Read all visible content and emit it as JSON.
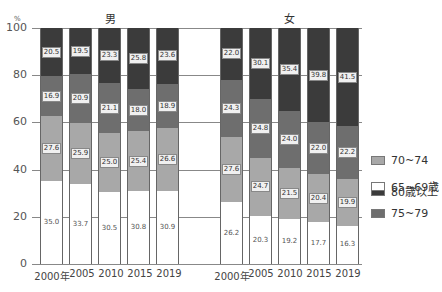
{
  "chart_data": {
    "type": "stacked-bar",
    "title": "",
    "ylabel": "%",
    "ylim": [
      0,
      100
    ],
    "yticks": [
      "0",
      "20",
      "40",
      "60",
      "80",
      "100"
    ],
    "panels": [
      {
        "title": "男",
        "categories": [
          "2000年",
          "2005",
          "2010",
          "2015",
          "2019"
        ],
        "series": [
          {
            "name": "65~69歳",
            "values": [
              35.0,
              33.7,
              30.5,
              30.8,
              30.9
            ]
          },
          {
            "name": "70~74",
            "values": [
              27.6,
              25.9,
              25.0,
              25.4,
              26.6
            ]
          },
          {
            "name": "75~79",
            "values": [
              16.9,
              20.9,
              21.1,
              18.0,
              18.9
            ]
          },
          {
            "name": "80歳以上",
            "values": [
              20.5,
              19.5,
              23.3,
              25.8,
              23.6
            ]
          }
        ]
      },
      {
        "title": "女",
        "categories": [
          "2000年",
          "2005",
          "2010",
          "2015",
          "2019"
        ],
        "series": [
          {
            "name": "65~69歳",
            "values": [
              26.2,
              20.3,
              19.2,
              17.7,
              16.3
            ]
          },
          {
            "name": "70~74",
            "values": [
              27.6,
              24.7,
              21.5,
              20.4,
              19.9
            ]
          },
          {
            "name": "75~79",
            "values": [
              24.3,
              24.8,
              24.0,
              22.0,
              22.2
            ]
          },
          {
            "name": "80歳以上",
            "values": [
              22.0,
              30.1,
              35.4,
              39.8,
              41.5
            ]
          }
        ]
      }
    ],
    "legend": [
      {
        "name": "80歳以上",
        "color": "#3b3b3b"
      },
      {
        "name": "75~79",
        "color": "#6e6e6e"
      },
      {
        "name": "70~74",
        "color": "#a8a8a8"
      },
      {
        "name": "65~69歳",
        "color": "#ffffff"
      }
    ],
    "legend_position": "right",
    "grid": true
  },
  "labels": {
    "y_unit": "%",
    "men": "男",
    "women": "女",
    "ticks": [
      "0",
      "20",
      "40",
      "60",
      "80",
      "100"
    ],
    "men_years": [
      "2000年",
      "2005",
      "2010",
      "2015",
      "2019"
    ],
    "women_years": [
      "2000年",
      "2005",
      "2010",
      "2015",
      "2019"
    ],
    "legend": [
      "80歳以上",
      "75~79",
      "70~74",
      "65~69歳"
    ]
  },
  "values": {
    "men": [
      [
        "35.0",
        "27.6",
        "16.9",
        "20.5"
      ],
      [
        "33.7",
        "25.9",
        "20.9",
        "19.5"
      ],
      [
        "30.5",
        "25.0",
        "21.1",
        "23.3"
      ],
      [
        "30.8",
        "25.4",
        "18.0",
        "25.8"
      ],
      [
        "30.9",
        "26.6",
        "18.9",
        "23.6"
      ]
    ],
    "women": [
      [
        "26.2",
        "27.6",
        "24.3",
        "22.0"
      ],
      [
        "20.3",
        "24.7",
        "24.8",
        "30.1"
      ],
      [
        "19.2",
        "21.5",
        "24.0",
        "35.4"
      ],
      [
        "17.7",
        "20.4",
        "22.0",
        "39.8"
      ],
      [
        "16.3",
        "19.9",
        "22.2",
        "41.5"
      ]
    ]
  }
}
